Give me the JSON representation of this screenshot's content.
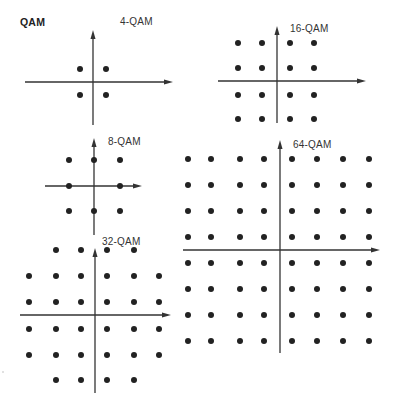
{
  "title": "QAM",
  "colors": {
    "background": "#ffffff",
    "ink": "#222222",
    "axis": "#333333"
  },
  "diagrams": [
    {
      "name": "4-QAM",
      "label": "4-QAM",
      "label_pos": [
        120,
        14
      ],
      "axes": {
        "v": {
          "x": 93,
          "y1": 30,
          "y2": 125
        },
        "h": {
          "y": 82,
          "x1": 25,
          "x2": 173
        }
      },
      "xs": [
        80,
        106
      ],
      "ys": [
        69,
        95
      ],
      "points": "full"
    },
    {
      "name": "16-QAM",
      "label": "16-QAM",
      "label_pos": [
        290,
        21
      ],
      "axes": {
        "v": {
          "x": 277,
          "y1": 26,
          "y2": 123
        },
        "h": {
          "y": 81,
          "x1": 218,
          "x2": 366
        }
      },
      "xs": [
        238,
        262,
        290,
        314
      ],
      "ys": [
        43,
        68,
        95,
        119
      ],
      "points": "full"
    },
    {
      "name": "8-QAM",
      "label": "8-QAM",
      "label_pos": [
        108,
        134
      ],
      "axes": {
        "v": {
          "x": 94,
          "y1": 138,
          "y2": 235
        },
        "h": {
          "y": 186,
          "x1": 45,
          "x2": 142
        }
      },
      "xs": [
        69,
        94,
        120
      ],
      "ys": [
        160,
        186,
        211
      ],
      "points": "skip-center"
    },
    {
      "name": "32-QAM",
      "label": "32-QAM",
      "label_pos": [
        102,
        234
      ],
      "axes": {
        "v": {
          "x": 95,
          "y1": 248,
          "y2": 393
        },
        "h": {
          "y": 315,
          "x1": 20,
          "x2": 171
        }
      },
      "xs": [
        29,
        56,
        81,
        107,
        134,
        159
      ],
      "ys": [
        250,
        276,
        302,
        329,
        355,
        380
      ],
      "points": "cross"
    },
    {
      "name": "64-QAM",
      "label": "64-QAM",
      "label_pos": [
        293,
        137
      ],
      "axes": {
        "v": {
          "x": 280,
          "y1": 140,
          "y2": 353
        },
        "h": {
          "y": 250,
          "x1": 183,
          "x2": 380
        }
      },
      "xs": [
        188,
        211,
        240,
        264,
        292,
        317,
        343,
        369
      ],
      "ys": [
        159,
        185,
        211,
        237,
        263,
        289,
        315,
        341
      ],
      "points": "full"
    }
  ],
  "dot_radius": 3,
  "stray_mark": {
    "x": 3,
    "y": 372
  }
}
